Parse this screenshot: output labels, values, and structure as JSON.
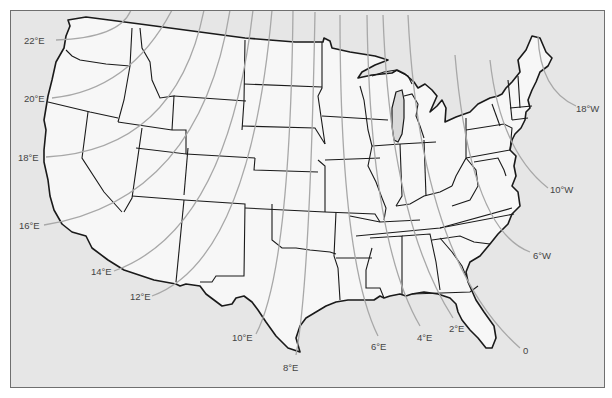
{
  "map": {
    "title": "Isogonic lines of magnetic declination, contiguous United States",
    "colors": {
      "ocean": "#e6e6e6",
      "land": "#f7f7f7",
      "border": "#1a1a1a",
      "isogonic": "#a8a8a8",
      "label": "#444444",
      "lake": "#d9d9d9"
    },
    "isogonic_labels": [
      {
        "id": "22E",
        "text": "22°E",
        "x": 26,
        "y": 36
      },
      {
        "id": "20E",
        "text": "20°E",
        "x": 24,
        "y": 94
      },
      {
        "id": "18E",
        "text": "18°E",
        "x": 18,
        "y": 153
      },
      {
        "id": "16E",
        "text": "16°E",
        "x": 20,
        "y": 221
      },
      {
        "id": "14E",
        "text": "14°E",
        "x": 92,
        "y": 267
      },
      {
        "id": "12E",
        "text": "12°E",
        "x": 130,
        "y": 292
      },
      {
        "id": "10E",
        "text": "10°E",
        "x": 232,
        "y": 332
      },
      {
        "id": "8E",
        "text": "8°E",
        "x": 283,
        "y": 362
      },
      {
        "id": "6E",
        "text": "6°E",
        "x": 371,
        "y": 342
      },
      {
        "id": "4E",
        "text": "4°E",
        "x": 417,
        "y": 332
      },
      {
        "id": "2E",
        "text": "2°E",
        "x": 449,
        "y": 323
      },
      {
        "id": "0",
        "text": "0",
        "x": 523,
        "y": 346
      },
      {
        "id": "6W",
        "text": "6°W",
        "x": 533,
        "y": 250
      },
      {
        "id": "10W",
        "text": "10°W",
        "x": 550,
        "y": 185
      },
      {
        "id": "18W",
        "text": "18°W",
        "x": 576,
        "y": 104
      }
    ]
  }
}
